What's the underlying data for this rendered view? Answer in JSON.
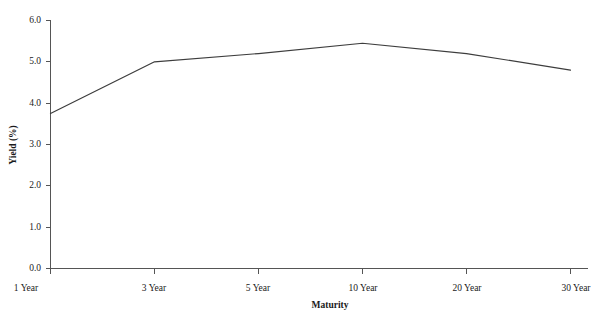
{
  "chart_data": {
    "type": "line",
    "title": "",
    "subtitle": "",
    "xlabel": "Maturity",
    "ylabel": "Yield (%)",
    "categories": [
      "1 Year",
      "3 Year",
      "5 Year",
      "10 Year",
      "20 Year",
      "30 Year"
    ],
    "values": [
      3.75,
      5.0,
      5.2,
      5.45,
      5.2,
      4.8
    ],
    "series": [
      {
        "name": "Yield",
        "values": [
          3.75,
          5.0,
          5.2,
          5.45,
          5.2,
          4.8
        ],
        "color": "#3d3d3d"
      }
    ],
    "ylim": [
      0.0,
      6.0
    ],
    "ytick_values": [
      0.0,
      1.0,
      2.0,
      3.0,
      4.0,
      5.0,
      6.0
    ],
    "ytick_labels": [
      "0.0",
      "1.0",
      "2.0",
      "3.0",
      "4.0",
      "5.0",
      "6.0"
    ],
    "xtick_labels": [
      "1 Year",
      "3 Year",
      "5 Year",
      "10 Year",
      "20 Year",
      "30 Year"
    ],
    "grid": false,
    "legend": false,
    "legend_position": "none",
    "annotations": []
  },
  "axes": {
    "y_title": "Yield (%)",
    "x_title": "Maturity"
  },
  "colors": {
    "series": "#3d3d3d",
    "axis": "#555555",
    "text": "#1a1a1a",
    "background": "#ffffff"
  }
}
